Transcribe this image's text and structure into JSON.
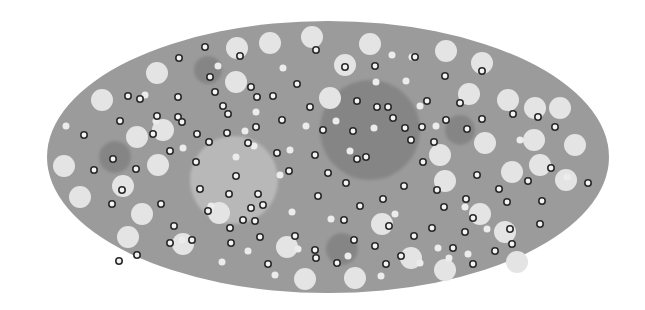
{
  "canvas": {
    "width": 645,
    "height": 310,
    "background": "#ffffff"
  },
  "colors": {
    "body_fill": "#9b9b9b",
    "large_light": "#e4e4e4",
    "small_light": "#ececec",
    "ring_stroke": "#2a2a2a",
    "ring_fill": "#f4f4f4",
    "dark_zone": "#7f7f7f",
    "light_zone": "#bdbdbd"
  },
  "body": {
    "cx": 328,
    "cy": 157,
    "rx": 281,
    "ry": 136
  },
  "zones": [
    {
      "kind": "dark",
      "cx": 370,
      "cy": 130,
      "r": 50
    },
    {
      "kind": "light",
      "cx": 234,
      "cy": 180,
      "r": 44
    },
    {
      "kind": "dark",
      "cx": 115,
      "cy": 157,
      "r": 16
    },
    {
      "kind": "dark",
      "cx": 208,
      "cy": 70,
      "r": 14
    },
    {
      "kind": "dark",
      "cx": 460,
      "cy": 130,
      "r": 15
    },
    {
      "kind": "dark",
      "cx": 342,
      "cy": 249,
      "r": 16
    },
    {
      "kind": "dark",
      "cx": 125,
      "cy": 170,
      "r": 0
    }
  ],
  "large_circles": [
    {
      "cx": 157,
      "cy": 73,
      "r": 11
    },
    {
      "cx": 102,
      "cy": 100,
      "r": 11
    },
    {
      "cx": 237,
      "cy": 48,
      "r": 11
    },
    {
      "cx": 270,
      "cy": 43,
      "r": 11
    },
    {
      "cx": 312,
      "cy": 37,
      "r": 11
    },
    {
      "cx": 370,
      "cy": 44,
      "r": 11
    },
    {
      "cx": 345,
      "cy": 65,
      "r": 11
    },
    {
      "cx": 236,
      "cy": 82,
      "r": 11
    },
    {
      "cx": 330,
      "cy": 98,
      "r": 11
    },
    {
      "cx": 225,
      "cy": 80,
      "r": 0
    },
    {
      "cx": 446,
      "cy": 51,
      "r": 11
    },
    {
      "cx": 482,
      "cy": 63,
      "r": 11
    },
    {
      "cx": 469,
      "cy": 94,
      "r": 11
    },
    {
      "cx": 508,
      "cy": 100,
      "r": 11
    },
    {
      "cx": 535,
      "cy": 108,
      "r": 11
    },
    {
      "cx": 560,
      "cy": 108,
      "r": 11
    },
    {
      "cx": 575,
      "cy": 145,
      "r": 11
    },
    {
      "cx": 485,
      "cy": 143,
      "r": 11
    },
    {
      "cx": 534,
      "cy": 140,
      "r": 11
    },
    {
      "cx": 440,
      "cy": 155,
      "r": 11
    },
    {
      "cx": 540,
      "cy": 165,
      "r": 11
    },
    {
      "cx": 512,
      "cy": 172,
      "r": 11
    },
    {
      "cx": 566,
      "cy": 180,
      "r": 11
    },
    {
      "cx": 445,
      "cy": 181,
      "r": 11
    },
    {
      "cx": 480,
      "cy": 214,
      "r": 11
    },
    {
      "cx": 505,
      "cy": 232,
      "r": 11
    },
    {
      "cx": 517,
      "cy": 262,
      "r": 11
    },
    {
      "cx": 445,
      "cy": 270,
      "r": 11
    },
    {
      "cx": 411,
      "cy": 258,
      "r": 11
    },
    {
      "cx": 382,
      "cy": 224,
      "r": 11
    },
    {
      "cx": 355,
      "cy": 278,
      "r": 11
    },
    {
      "cx": 287,
      "cy": 247,
      "r": 11
    },
    {
      "cx": 305,
      "cy": 279,
      "r": 11
    },
    {
      "cx": 230,
      "cy": 194,
      "r": 0
    },
    {
      "cx": 219,
      "cy": 213,
      "r": 11
    },
    {
      "cx": 183,
      "cy": 244,
      "r": 11
    },
    {
      "cx": 128,
      "cy": 237,
      "r": 11
    },
    {
      "cx": 142,
      "cy": 214,
      "r": 11
    },
    {
      "cx": 158,
      "cy": 165,
      "r": 11
    },
    {
      "cx": 123,
      "cy": 186,
      "r": 11
    },
    {
      "cx": 80,
      "cy": 197,
      "r": 11
    },
    {
      "cx": 64,
      "cy": 166,
      "r": 11
    },
    {
      "cx": 137,
      "cy": 137,
      "r": 11
    },
    {
      "cx": 162,
      "cy": 120,
      "r": 0
    },
    {
      "cx": 163,
      "cy": 130,
      "r": 11
    },
    {
      "cx": 200,
      "cy": 130,
      "r": 0
    }
  ],
  "small_circles": [
    {
      "cx": 66,
      "cy": 126
    },
    {
      "cx": 145,
      "cy": 95
    },
    {
      "cx": 156,
      "cy": 121
    },
    {
      "cx": 183,
      "cy": 148
    },
    {
      "cx": 182,
      "cy": 240
    },
    {
      "cx": 218,
      "cy": 66
    },
    {
      "cx": 283,
      "cy": 68
    },
    {
      "cx": 256,
      "cy": 112
    },
    {
      "cx": 306,
      "cy": 126
    },
    {
      "cx": 211,
      "cy": 206
    },
    {
      "cx": 254,
      "cy": 146
    },
    {
      "cx": 290,
      "cy": 150
    },
    {
      "cx": 245,
      "cy": 131
    },
    {
      "cx": 236,
      "cy": 157
    },
    {
      "cx": 280,
      "cy": 175
    },
    {
      "cx": 292,
      "cy": 212
    },
    {
      "cx": 248,
      "cy": 251
    },
    {
      "cx": 222,
      "cy": 262
    },
    {
      "cx": 275,
      "cy": 275
    },
    {
      "cx": 331,
      "cy": 219
    },
    {
      "cx": 336,
      "cy": 121
    },
    {
      "cx": 374,
      "cy": 128
    },
    {
      "cx": 350,
      "cy": 151
    },
    {
      "cx": 376,
      "cy": 82
    },
    {
      "cx": 392,
      "cy": 55
    },
    {
      "cx": 406,
      "cy": 81
    },
    {
      "cx": 412,
      "cy": 57
    },
    {
      "cx": 420,
      "cy": 106
    },
    {
      "cx": 465,
      "cy": 207
    },
    {
      "cx": 436,
      "cy": 126
    },
    {
      "cx": 520,
      "cy": 140
    },
    {
      "cx": 567,
      "cy": 177
    },
    {
      "cx": 487,
      "cy": 229
    },
    {
      "cx": 395,
      "cy": 214
    },
    {
      "cx": 468,
      "cy": 254
    },
    {
      "cx": 449,
      "cy": 258
    },
    {
      "cx": 438,
      "cy": 248
    },
    {
      "cx": 420,
      "cy": 263
    },
    {
      "cx": 381,
      "cy": 276
    },
    {
      "cx": 348,
      "cy": 256
    },
    {
      "cx": 298,
      "cy": 249
    }
  ],
  "ring_dots": [
    {
      "cx": 205,
      "cy": 47
    },
    {
      "cx": 179,
      "cy": 58
    },
    {
      "cx": 240,
      "cy": 56
    },
    {
      "cx": 210,
      "cy": 77
    },
    {
      "cx": 316,
      "cy": 50
    },
    {
      "cx": 345,
      "cy": 67
    },
    {
      "cx": 375,
      "cy": 66
    },
    {
      "cx": 415,
      "cy": 57
    },
    {
      "cx": 482,
      "cy": 71
    },
    {
      "cx": 445,
      "cy": 76
    },
    {
      "cx": 128,
      "cy": 96
    },
    {
      "cx": 178,
      "cy": 97
    },
    {
      "cx": 215,
      "cy": 92
    },
    {
      "cx": 251,
      "cy": 87
    },
    {
      "cx": 273,
      "cy": 96
    },
    {
      "cx": 223,
      "cy": 106
    },
    {
      "cx": 297,
      "cy": 84
    },
    {
      "cx": 257,
      "cy": 97
    },
    {
      "cx": 178,
      "cy": 117
    },
    {
      "cx": 120,
      "cy": 121
    },
    {
      "cx": 84,
      "cy": 135
    },
    {
      "cx": 157,
      "cy": 116
    },
    {
      "cx": 228,
      "cy": 114
    },
    {
      "cx": 182,
      "cy": 122
    },
    {
      "cx": 310,
      "cy": 107
    },
    {
      "cx": 282,
      "cy": 120
    },
    {
      "cx": 256,
      "cy": 127
    },
    {
      "cx": 227,
      "cy": 133
    },
    {
      "cx": 197,
      "cy": 134
    },
    {
      "cx": 153,
      "cy": 134
    },
    {
      "cx": 357,
      "cy": 101
    },
    {
      "cx": 388,
      "cy": 107
    },
    {
      "cx": 427,
      "cy": 101
    },
    {
      "cx": 460,
      "cy": 103
    },
    {
      "cx": 422,
      "cy": 127
    },
    {
      "cx": 446,
      "cy": 120
    },
    {
      "cx": 467,
      "cy": 129
    },
    {
      "cx": 482,
      "cy": 119
    },
    {
      "cx": 513,
      "cy": 114
    },
    {
      "cx": 555,
      "cy": 127
    },
    {
      "cx": 538,
      "cy": 117
    },
    {
      "cx": 113,
      "cy": 159
    },
    {
      "cx": 94,
      "cy": 170
    },
    {
      "cx": 136,
      "cy": 169
    },
    {
      "cx": 122,
      "cy": 190
    },
    {
      "cx": 112,
      "cy": 204
    },
    {
      "cx": 161,
      "cy": 204
    },
    {
      "cx": 170,
      "cy": 151
    },
    {
      "cx": 196,
      "cy": 162
    },
    {
      "cx": 209,
      "cy": 142
    },
    {
      "cx": 236,
      "cy": 176
    },
    {
      "cx": 200,
      "cy": 189
    },
    {
      "cx": 229,
      "cy": 194
    },
    {
      "cx": 251,
      "cy": 208
    },
    {
      "cx": 263,
      "cy": 205
    },
    {
      "cx": 243,
      "cy": 220
    },
    {
      "cx": 230,
      "cy": 228
    },
    {
      "cx": 258,
      "cy": 194
    },
    {
      "cx": 277,
      "cy": 153
    },
    {
      "cx": 289,
      "cy": 171
    },
    {
      "cx": 315,
      "cy": 155
    },
    {
      "cx": 323,
      "cy": 130
    },
    {
      "cx": 353,
      "cy": 131
    },
    {
      "cx": 377,
      "cy": 107
    },
    {
      "cx": 393,
      "cy": 118
    },
    {
      "cx": 405,
      "cy": 128
    },
    {
      "cx": 411,
      "cy": 140
    },
    {
      "cx": 357,
      "cy": 159
    },
    {
      "cx": 366,
      "cy": 157
    },
    {
      "cx": 328,
      "cy": 173
    },
    {
      "cx": 346,
      "cy": 183
    },
    {
      "cx": 318,
      "cy": 196
    },
    {
      "cx": 360,
      "cy": 206
    },
    {
      "cx": 383,
      "cy": 199
    },
    {
      "cx": 404,
      "cy": 186
    },
    {
      "cx": 423,
      "cy": 162
    },
    {
      "cx": 434,
      "cy": 142
    },
    {
      "cx": 437,
      "cy": 190
    },
    {
      "cx": 444,
      "cy": 207
    },
    {
      "cx": 466,
      "cy": 199
    },
    {
      "cx": 477,
      "cy": 175
    },
    {
      "cx": 499,
      "cy": 189
    },
    {
      "cx": 507,
      "cy": 202
    },
    {
      "cx": 528,
      "cy": 181
    },
    {
      "cx": 551,
      "cy": 168
    },
    {
      "cx": 588,
      "cy": 183
    },
    {
      "cx": 540,
      "cy": 224
    },
    {
      "cx": 542,
      "cy": 201
    },
    {
      "cx": 510,
      "cy": 229
    },
    {
      "cx": 465,
      "cy": 232
    },
    {
      "cx": 473,
      "cy": 218
    },
    {
      "cx": 432,
      "cy": 228
    },
    {
      "cx": 414,
      "cy": 236
    },
    {
      "cx": 401,
      "cy": 256
    },
    {
      "cx": 375,
      "cy": 246
    },
    {
      "cx": 354,
      "cy": 240
    },
    {
      "cx": 337,
      "cy": 263
    },
    {
      "cx": 315,
      "cy": 250
    },
    {
      "cx": 295,
      "cy": 236
    },
    {
      "cx": 260,
      "cy": 237
    },
    {
      "cx": 231,
      "cy": 243
    },
    {
      "cx": 192,
      "cy": 240
    },
    {
      "cx": 174,
      "cy": 226
    },
    {
      "cx": 170,
      "cy": 243
    },
    {
      "cx": 119,
      "cy": 261
    },
    {
      "cx": 137,
      "cy": 255
    },
    {
      "cx": 268,
      "cy": 264
    },
    {
      "cx": 316,
      "cy": 258
    },
    {
      "cx": 386,
      "cy": 264
    },
    {
      "cx": 453,
      "cy": 248
    },
    {
      "cx": 473,
      "cy": 264
    },
    {
      "cx": 495,
      "cy": 251
    },
    {
      "cx": 512,
      "cy": 244
    },
    {
      "cx": 344,
      "cy": 220
    },
    {
      "cx": 389,
      "cy": 226
    },
    {
      "cx": 140,
      "cy": 99
    },
    {
      "cx": 208,
      "cy": 211
    },
    {
      "cx": 248,
      "cy": 143
    },
    {
      "cx": 255,
      "cy": 221
    }
  ]
}
